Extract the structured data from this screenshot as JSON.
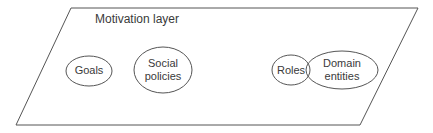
{
  "layer": {
    "title": "Motivation layer"
  },
  "nodes": [
    {
      "id": "goals",
      "lines": [
        "Goals"
      ]
    },
    {
      "id": "social-policies",
      "lines": [
        "Social",
        "policies"
      ]
    },
    {
      "id": "roles",
      "lines": [
        "Roles"
      ]
    },
    {
      "id": "domain-entities",
      "lines": [
        "Domain",
        "entities"
      ]
    }
  ]
}
